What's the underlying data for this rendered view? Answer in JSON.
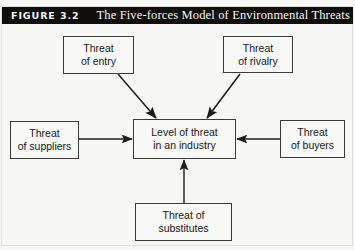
{
  "figure": {
    "number_label": "FIGURE 3.2",
    "title": "The Five-forces Model of Environmental Threats"
  },
  "colors": {
    "header_background": "#100f0d",
    "header_text": "#f6f5f2",
    "page_background": "#f7f7f5",
    "box_border": "#3a3a3a",
    "box_fill": "#f8f8f6",
    "arrow": "#1c1c1c",
    "body_text": "#17171a"
  },
  "diagram": {
    "type": "five-forces-model",
    "nodes": [
      {
        "id": "entry",
        "lines": [
          "Threat",
          "of entry"
        ],
        "position": "top-left"
      },
      {
        "id": "rivalry",
        "lines": [
          "Threat",
          "of rivalry"
        ],
        "position": "top-right"
      },
      {
        "id": "suppliers",
        "lines": [
          "Threat",
          "of suppliers"
        ],
        "position": "left"
      },
      {
        "id": "center",
        "lines": [
          "Level of threat",
          "in an industry"
        ],
        "position": "center"
      },
      {
        "id": "buyers",
        "lines": [
          "Threat",
          "of buyers"
        ],
        "position": "right"
      },
      {
        "id": "substitutes",
        "lines": [
          "Threat of",
          "substitutes"
        ],
        "position": "bottom"
      }
    ],
    "arrows": [
      {
        "id": "entry-to-center",
        "from": "entry",
        "to": "center",
        "direction": "diagonal-down-right"
      },
      {
        "id": "rivalry-to-center",
        "from": "rivalry",
        "to": "center",
        "direction": "diagonal-down-left"
      },
      {
        "id": "suppliers-to-center",
        "from": "suppliers",
        "to": "center",
        "direction": "right"
      },
      {
        "id": "buyers-to-center",
        "from": "buyers",
        "to": "center",
        "direction": "left"
      },
      {
        "id": "substitutes-to-center",
        "from": "substitutes",
        "to": "center",
        "direction": "up"
      }
    ]
  }
}
